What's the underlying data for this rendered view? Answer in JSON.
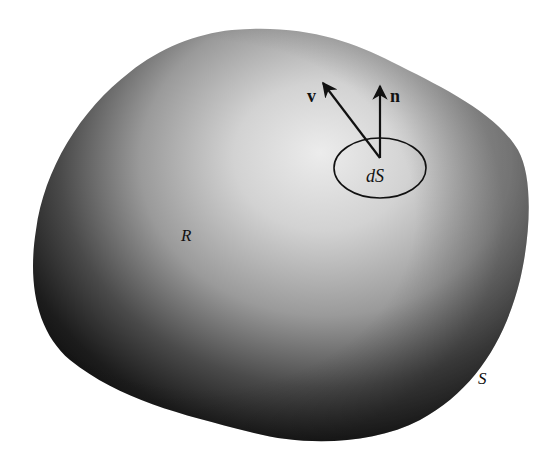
{
  "figure": {
    "type": "surface-integral-region",
    "region_label": "R",
    "surface_label": "S",
    "element_label": "dS",
    "vectors": [
      {
        "name": "velocity",
        "label": "v"
      },
      {
        "name": "normal",
        "label": "n"
      }
    ],
    "colors": {
      "background": "#ffffff",
      "shade_dark": "#1a1a1a",
      "shade_mid": "#6e6e6e",
      "highlight": "#e6e6e6",
      "ink": "#111111"
    }
  }
}
